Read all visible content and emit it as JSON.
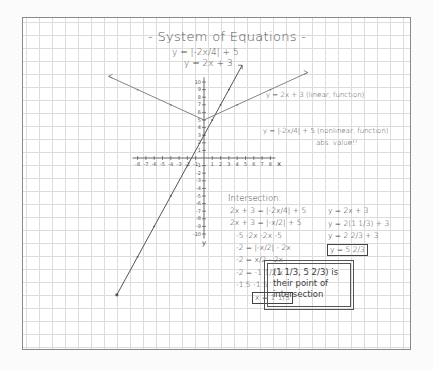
{
  "title": "- System of Equations -",
  "equations": {
    "eq1": "y = |-2x/4| + 5",
    "eq2": "y = 2x + 3"
  },
  "graph": {
    "x_axis_label": "x",
    "y_axis_label": "y",
    "x_ticks": [
      "-8",
      "-7",
      "-6",
      "-5",
      "-4",
      "-3",
      "-2",
      "-1",
      "1",
      "2",
      "3",
      "4",
      "5",
      "6",
      "7",
      "8"
    ],
    "y_ticks_pos": [
      "1",
      "2",
      "3",
      "4",
      "5",
      "6",
      "7",
      "8",
      "9",
      "10"
    ],
    "y_ticks_neg": [
      "-1",
      "-2",
      "-3",
      "-4",
      "-5",
      "-6",
      "-7",
      "-8",
      "-9",
      "-10"
    ],
    "line_label": "y = 2x + 3 (linear, function)",
    "abs_label": "y = |-2x/4| + 5 (nonlinear, function)",
    "abs_note": "abs. value!!",
    "line_color": "#555555",
    "abs_color": "#777777"
  },
  "work": {
    "heading": "Intersection:",
    "left_steps": [
      "2x + 3 = |-2x/4| + 5",
      "2x + 3 = |-x/2| + 5",
      "-5  -2x      -2x   -5",
      "-2 = |-x/2| - 2x",
      "-2 = x/2 - 2x",
      "-2 = -1 1/2 x",
      "-1.5    -1.5"
    ],
    "x_result": "x = 1 1/3",
    "right_steps": [
      "y = 2x + 3",
      "y = 2(1 1/3) + 3",
      "y = 2 2/3 + 3"
    ],
    "y_result": "y = 5 2/3"
  },
  "conclusion": "(1 1/3, 5 2/3) is their point of intersection"
}
